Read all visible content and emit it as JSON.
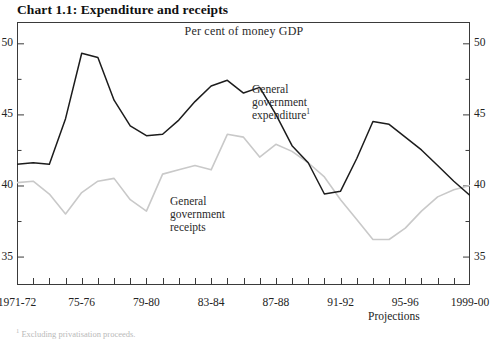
{
  "title": "Chart 1.1: Expenditure and receipts",
  "subtitle": "Per cent of money GDP",
  "projections_note": "Projections",
  "footnote": {
    "mark": "1",
    "text": " Excluding privatisation proceeds."
  },
  "annotations": {
    "expenditure": {
      "line1": "General",
      "line2": "government",
      "line3": "expenditure",
      "superscript": "1"
    },
    "receipts": {
      "line1": "General",
      "line2": "government",
      "line3": "receipts"
    }
  },
  "colors": {
    "expenditure_line": "#1c1c1c",
    "receipts_line": "#c9c9c9",
    "frame": "#3a3a3a",
    "text": "#232323"
  },
  "chart_data": {
    "type": "line",
    "title": "Chart 1.1: Expenditure and receipts",
    "subtitle": "Per cent of money GDP",
    "xlabel": "",
    "ylabel": "Per cent of money GDP",
    "ylim": [
      33,
      51.5
    ],
    "yticks": [
      35,
      40,
      45,
      50
    ],
    "yticks_minor": [
      37.5,
      42.5,
      47.5
    ],
    "ytick_labels": [
      "35",
      "40",
      "45",
      "50"
    ],
    "grid": false,
    "legend": "inline-annotations",
    "x": [
      "1971-72",
      "1972-73",
      "1973-74",
      "1974-75",
      "1975-76",
      "1976-77",
      "1977-78",
      "1978-79",
      "1979-80",
      "1980-81",
      "1981-82",
      "1982-83",
      "1983-84",
      "1984-85",
      "1985-86",
      "1986-87",
      "1987-88",
      "1988-89",
      "1989-90",
      "1990-91",
      "1991-92",
      "1992-93",
      "1993-94",
      "1994-95",
      "1995-96",
      "1996-97",
      "1997-98",
      "1998-99",
      "1999-00"
    ],
    "xtick_labels": [
      "1971-72",
      "75-76",
      "79-80",
      "83-84",
      "87-88",
      "91-92",
      "95-96",
      "1999-00"
    ],
    "xtick_indices": [
      0,
      4,
      8,
      12,
      16,
      20,
      24,
      28
    ],
    "projection_start": "1996-97",
    "series": [
      {
        "name": "General government expenditure",
        "color": "#1c1c1c",
        "values": [
          41.5,
          41.6,
          41.5,
          44.7,
          49.3,
          49.0,
          46.0,
          44.2,
          43.5,
          43.6,
          44.6,
          45.9,
          47.0,
          47.4,
          46.5,
          46.9,
          45.0,
          42.8,
          41.6,
          39.4,
          39.6,
          41.9,
          44.5,
          44.3,
          43.4,
          42.5,
          41.4,
          40.3,
          39.3
        ]
      },
      {
        "name": "General government receipts",
        "color": "#c9c9c9",
        "values": [
          40.2,
          40.3,
          39.4,
          38.0,
          39.5,
          40.3,
          40.5,
          39.0,
          38.2,
          40.8,
          41.1,
          41.4,
          41.1,
          43.6,
          43.4,
          42.0,
          42.9,
          42.4,
          41.6,
          40.6,
          39.0,
          37.6,
          36.2,
          36.2,
          37.0,
          38.2,
          39.2,
          39.7,
          40.0
        ]
      }
    ]
  }
}
